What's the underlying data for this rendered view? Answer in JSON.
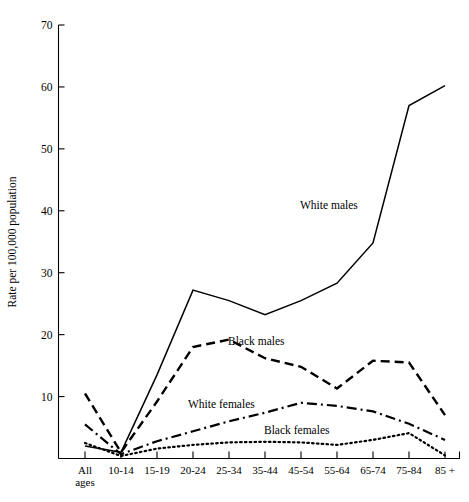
{
  "chart_data": {
    "type": "line",
    "title": "",
    "xlabel": "",
    "ylabel": "Rate per 100,000 population",
    "ylim": [
      0,
      70
    ],
    "yticks": [
      0,
      10,
      20,
      30,
      40,
      50,
      60,
      70
    ],
    "ytick_labels": [
      "",
      "10",
      "20",
      "30",
      "40",
      "50",
      "60",
      "70"
    ],
    "grid": false,
    "legend_position": "inline-annotations",
    "categories": [
      "All ages",
      "10-14",
      "15-19",
      "20-24",
      "25-34",
      "35-44",
      "45-54",
      "55-64",
      "65-74",
      "75-84",
      "85 +"
    ],
    "category_lines": [
      [
        "All",
        "ages"
      ],
      [
        "10-14"
      ],
      [
        "15-19"
      ],
      [
        "20-24"
      ],
      [
        "25-34"
      ],
      [
        "35-44"
      ],
      [
        "45-54"
      ],
      [
        "55-64"
      ],
      [
        "65-74"
      ],
      [
        "75-84"
      ],
      [
        "85 +"
      ]
    ],
    "series": [
      {
        "name": "White males",
        "style": "solid",
        "values": [
          2.0,
          1.0,
          13.5,
          27.2,
          25.5,
          23.2,
          25.5,
          28.3,
          34.8,
          57.0,
          60.2
        ]
      },
      {
        "name": "Black males",
        "style": "dashed",
        "values": [
          10.5,
          1.0,
          9.2,
          18.0,
          19.2,
          16.2,
          14.8,
          11.3,
          15.8,
          15.5,
          7.0
        ]
      },
      {
        "name": "White females",
        "style": "dash-dot",
        "values": [
          5.5,
          0.7,
          2.8,
          4.4,
          6.0,
          7.4,
          9.0,
          8.5,
          7.6,
          5.6,
          3.0
        ]
      },
      {
        "name": "Black females",
        "style": "dotted",
        "values": [
          2.5,
          0.4,
          1.6,
          2.2,
          2.6,
          2.7,
          2.6,
          2.2,
          3.0,
          4.1,
          0.5
        ]
      }
    ],
    "annotations": [
      {
        "text": "White males",
        "x_px": 300,
        "y_px": 209
      },
      {
        "text": "Black males",
        "x_px": 228,
        "y_px": 345
      },
      {
        "text": "White females",
        "x_px": 188,
        "y_px": 408
      },
      {
        "text": "Black females",
        "x_px": 264,
        "y_px": 434
      }
    ]
  }
}
